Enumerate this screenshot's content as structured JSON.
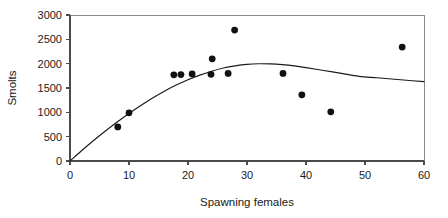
{
  "chart_data": {
    "type": "scatter",
    "title": "",
    "xlabel": "Spawning females",
    "ylabel": "Smolts",
    "xlim": [
      0,
      60
    ],
    "ylim": [
      0,
      3000
    ],
    "xticks": [
      0,
      10,
      20,
      30,
      40,
      50,
      60
    ],
    "yticks": [
      0,
      500,
      1000,
      1500,
      2000,
      2500,
      3000
    ],
    "xtick_labels": [
      "0",
      "10",
      "20",
      "30",
      "40",
      "50",
      "60"
    ],
    "ytick_labels": [
      "0",
      "500",
      "1000",
      "1500",
      "2000",
      "2500",
      "3000"
    ],
    "grid": false,
    "legend": "none",
    "marker": "filled-circle",
    "marker_color": "#111111",
    "points": [
      {
        "x": 8.1,
        "y": 700
      },
      {
        "x": 10.0,
        "y": 990
      },
      {
        "x": 17.6,
        "y": 1770
      },
      {
        "x": 18.8,
        "y": 1775
      },
      {
        "x": 20.7,
        "y": 1790
      },
      {
        "x": 23.9,
        "y": 1780
      },
      {
        "x": 24.1,
        "y": 2100
      },
      {
        "x": 26.8,
        "y": 1800
      },
      {
        "x": 27.9,
        "y": 2690
      },
      {
        "x": 36.1,
        "y": 1800
      },
      {
        "x": 39.3,
        "y": 1360
      },
      {
        "x": 44.2,
        "y": 1010
      },
      {
        "x": 56.3,
        "y": 2340
      }
    ],
    "fit_curve": {
      "name": "fitted stock-recruitment curve",
      "color": "#1a1a1a",
      "points": [
        {
          "x": 0.0,
          "y": 0
        },
        {
          "x": 2.0,
          "y": 215
        },
        {
          "x": 4.0,
          "y": 420
        },
        {
          "x": 6.0,
          "y": 615
        },
        {
          "x": 8.0,
          "y": 800
        },
        {
          "x": 10.0,
          "y": 975
        },
        {
          "x": 12.0,
          "y": 1140
        },
        {
          "x": 14.0,
          "y": 1295
        },
        {
          "x": 16.0,
          "y": 1435
        },
        {
          "x": 18.0,
          "y": 1560
        },
        {
          "x": 20.0,
          "y": 1670
        },
        {
          "x": 22.0,
          "y": 1765
        },
        {
          "x": 24.0,
          "y": 1845
        },
        {
          "x": 26.0,
          "y": 1910
        },
        {
          "x": 28.0,
          "y": 1955
        },
        {
          "x": 30.0,
          "y": 1985
        },
        {
          "x": 32.0,
          "y": 1998
        },
        {
          "x": 34.0,
          "y": 1995
        },
        {
          "x": 36.0,
          "y": 1980
        },
        {
          "x": 38.0,
          "y": 1955
        },
        {
          "x": 40.0,
          "y": 1920
        },
        {
          "x": 43.0,
          "y": 1860
        },
        {
          "x": 46.0,
          "y": 1800
        },
        {
          "x": 49.0,
          "y": 1740
        },
        {
          "x": 52.0,
          "y": 1710
        },
        {
          "x": 55.0,
          "y": 1680
        },
        {
          "x": 58.0,
          "y": 1650
        },
        {
          "x": 60.0,
          "y": 1630
        }
      ]
    }
  }
}
